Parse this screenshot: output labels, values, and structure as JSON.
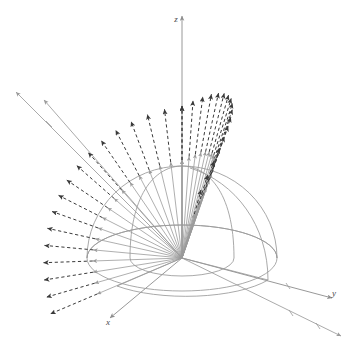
{
  "figure": {
    "title": "",
    "background": "#ffffff",
    "width": 355,
    "height": 348
  },
  "axes": {
    "z": {
      "label": "z",
      "label_x": 176,
      "label_y": 22
    },
    "y": {
      "label": "y",
      "label_x": 334,
      "label_y": 292
    },
    "x": {
      "label": "x",
      "label_x": 108,
      "label_y": 322
    }
  },
  "colors": {
    "axis": "#8c8c8c",
    "surface": "#9a9a9a",
    "inner_surface": "#a2a2a2",
    "solid_ray": "#9b9b9b",
    "dashed_arrow": "#3a3a3a",
    "label": "#4a4a4a",
    "background": "#ffffff"
  },
  "chart_data": {
    "type": "scatter",
    "title": "",
    "xlabel": "x",
    "ylabel": "y",
    "zlabel": "z",
    "projection": "3d-isometric",
    "origin": {
      "x": 182,
      "y": 258
    },
    "geometry": {
      "outer_hemisphere_radius": 95,
      "inner_dome_radius": 52,
      "equator_ellipse_rx": 95,
      "equator_ellipse_ry": 33,
      "pole_x": 182,
      "pole_y": 166
    },
    "series": [
      {
        "name": "radial-solid-rays",
        "style": "solid",
        "color": "#9b9b9b",
        "count": 34,
        "note": "rays from origin to hemisphere surface"
      },
      {
        "name": "radial-dashed-flux",
        "style": "dashed",
        "color": "#3a3a3a",
        "count": 34,
        "note": "dashed arrows continuing outward from surface"
      },
      {
        "name": "long-rays",
        "style": "solid",
        "color": "#9b9b9b",
        "count": 4,
        "note": "extended axis-like rays to figure corners"
      }
    ],
    "angles_deg": {
      "elevation_min": 0,
      "elevation_max": 90,
      "azimuth_samples": 2
    },
    "grid": false,
    "legend": "none"
  }
}
